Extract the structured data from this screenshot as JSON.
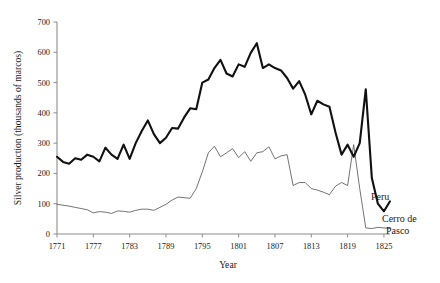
{
  "chart_data": {
    "type": "line",
    "title": "",
    "xlabel": "Year",
    "ylabel": "Silver production (thousands of marcos)",
    "xlim": [
      1771,
      1826
    ],
    "ylim": [
      0,
      700
    ],
    "yticks": [
      0,
      100,
      200,
      300,
      400,
      500,
      600,
      700
    ],
    "xticks": [
      1771,
      1777,
      1783,
      1789,
      1795,
      1801,
      1807,
      1813,
      1819,
      1825
    ],
    "grid": false,
    "legend_position": "inline-right",
    "x": [
      1771,
      1772,
      1773,
      1774,
      1775,
      1776,
      1777,
      1778,
      1779,
      1780,
      1781,
      1782,
      1783,
      1784,
      1785,
      1786,
      1787,
      1788,
      1789,
      1790,
      1791,
      1792,
      1793,
      1794,
      1795,
      1796,
      1797,
      1798,
      1799,
      1800,
      1801,
      1802,
      1803,
      1804,
      1805,
      1806,
      1807,
      1808,
      1809,
      1810,
      1811,
      1812,
      1813,
      1814,
      1815,
      1816,
      1817,
      1818,
      1819,
      1820,
      1821,
      1822,
      1823,
      1824,
      1825,
      1826
    ],
    "series": [
      {
        "name": "Peru",
        "style": "thick",
        "color": "#111111",
        "values": [
          255,
          238,
          232,
          250,
          245,
          262,
          255,
          240,
          285,
          262,
          248,
          295,
          248,
          300,
          340,
          375,
          330,
          300,
          318,
          350,
          348,
          385,
          415,
          412,
          500,
          510,
          548,
          575,
          530,
          520,
          560,
          552,
          598,
          630,
          548,
          560,
          548,
          540,
          515,
          480,
          505,
          460,
          395,
          440,
          428,
          420,
          335,
          262,
          295,
          255,
          300,
          478,
          185,
          100,
          75,
          108
        ]
      },
      {
        "name": "Cerro de Pasco",
        "style": "thin",
        "color": "#5a5a5a",
        "values": [
          98,
          95,
          92,
          88,
          84,
          80,
          70,
          74,
          72,
          68,
          76,
          75,
          72,
          78,
          82,
          82,
          78,
          88,
          98,
          112,
          122,
          120,
          118,
          150,
          205,
          268,
          290,
          255,
          268,
          282,
          252,
          272,
          240,
          268,
          272,
          288,
          248,
          258,
          262,
          160,
          170,
          170,
          150,
          145,
          138,
          130,
          158,
          170,
          160,
          295,
          150,
          20,
          18,
          22,
          20,
          18
        ]
      }
    ]
  },
  "axis": {
    "y_title": "Silver production (thousands of marcos)",
    "x_title": "Year",
    "y_tick_labels": [
      "0",
      "100",
      "200",
      "300",
      "400",
      "500",
      "600",
      "700"
    ],
    "x_tick_labels": [
      "1771",
      "1777",
      "1783",
      "1789",
      "1795",
      "1801",
      "1807",
      "1813",
      "1819",
      "1825"
    ]
  },
  "labels": {
    "peru": "Peru",
    "cerro_line1": "Cerro de",
    "cerro_line2": "Pasco"
  }
}
